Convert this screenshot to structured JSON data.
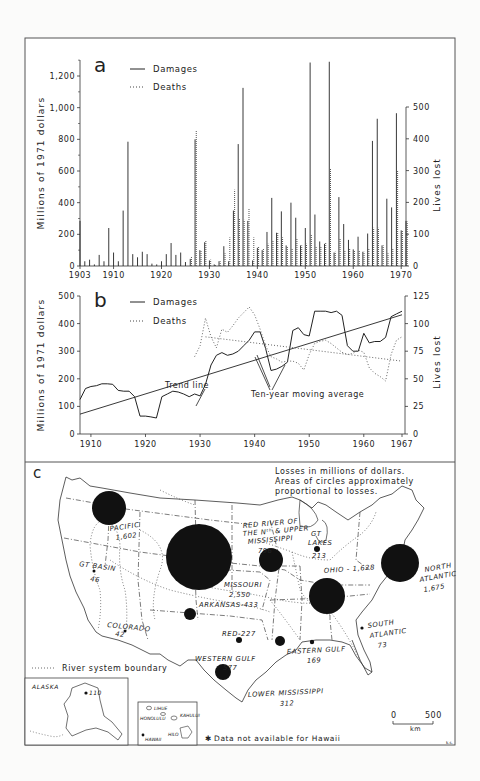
{
  "panels": {
    "a": {
      "label": "a",
      "legend": {
        "damages": "Damages",
        "deaths": "Deaths"
      },
      "y_left_label": "Millions of 1971 dollars",
      "y_right_label": "Lives lost",
      "y_left_ticks": [
        "0",
        "200",
        "400",
        "600",
        "800",
        "1,000",
        "1,200"
      ],
      "y_right_ticks": [
        "0",
        "100",
        "200",
        "300",
        "400",
        "500"
      ],
      "x_ticks": [
        "1903",
        "1910",
        "1920",
        "1930",
        "1940",
        "1950",
        "1960",
        "1970"
      ]
    },
    "b": {
      "label": "b",
      "legend": {
        "damages": "Damages",
        "deaths": "Deaths"
      },
      "y_left_label": "Millions of 1971 dollars",
      "y_right_label": "Lives lost",
      "y_left_ticks": [
        "0",
        "100",
        "200",
        "300",
        "400",
        "500"
      ],
      "y_right_ticks": [
        "0",
        "25",
        "50",
        "75",
        "100",
        "125"
      ],
      "x_ticks": [
        "1910",
        "1920",
        "1930",
        "1940",
        "1950",
        "1960",
        "1967"
      ],
      "annotations": {
        "trend": "Trend line",
        "moving_avg": "Ten-year moving average"
      }
    },
    "c": {
      "label": "c",
      "note_line1": "Losses in millions of dollars.",
      "note_line2": "Areas of circles approximately",
      "note_line3": "proportional to losses.",
      "boundary_legend": "River system boundary",
      "hawaii_note": "Data not available for Hawaii",
      "scale": {
        "zero": "0",
        "max": "500",
        "unit": "km"
      },
      "regions": [
        {
          "name": "PACIFIC",
          "value": "1,602"
        },
        {
          "name": "GT BASIN",
          "value": "46"
        },
        {
          "name": "COLORADO",
          "value": "42"
        },
        {
          "name": "MISSOURI",
          "value": "2,550"
        },
        {
          "name": "ARKANSAS",
          "value": "433"
        },
        {
          "name": "RED",
          "value": "227"
        },
        {
          "name": "WESTERN GULF",
          "value": "577"
        },
        {
          "name": "LOWER MISSISSIPPI",
          "value": "312"
        },
        {
          "name": "EASTERN GULF",
          "value": "169"
        },
        {
          "name": "SOUTH ATLANTIC",
          "value": "73"
        },
        {
          "name": "OHIO",
          "value": "1,628"
        },
        {
          "name": "NORTH ATLANTIC",
          "value": "1,675"
        },
        {
          "name": "GT LAKES",
          "value": "213"
        },
        {
          "name": "RED RIVER OF THE Nth & UPPER MISSISSIPPI",
          "value": "796"
        },
        {
          "name": "ALASKA",
          "value": "110"
        }
      ],
      "hawaii_places": [
        "LIHUE",
        "HONOLULU",
        "KAHULUI",
        "HILO",
        "HAWAII"
      ],
      "alaska_label": "ALASKA",
      "credit": "k.s."
    }
  },
  "chart_data": [
    {
      "type": "bar",
      "title": "a",
      "xlabel": "",
      "ylabel": "Millions of 1971 dollars",
      "y2label": "Lives lost",
      "ylim": [
        0,
        1300
      ],
      "y2lim": [
        0,
        500
      ],
      "x": [
        1903,
        1904,
        1905,
        1906,
        1907,
        1908,
        1909,
        1910,
        1911,
        1912,
        1913,
        1914,
        1915,
        1916,
        1917,
        1918,
        1919,
        1920,
        1921,
        1922,
        1923,
        1924,
        1925,
        1926,
        1927,
        1928,
        1929,
        1930,
        1931,
        1932,
        1933,
        1934,
        1935,
        1936,
        1937,
        1938,
        1939,
        1940,
        1941,
        1942,
        1943,
        1944,
        1945,
        1946,
        1947,
        1948,
        1949,
        1950,
        1951,
        1952,
        1953,
        1954,
        1955,
        1956,
        1957,
        1958,
        1959,
        1960,
        1961,
        1962,
        1963,
        1964,
        1965,
        1966,
        1967,
        1968,
        1969,
        1970,
        1971
      ],
      "series": [
        {
          "name": "Damages",
          "axis": "left",
          "values": [
            285,
            30,
            40,
            10,
            70,
            30,
            240,
            85,
            30,
            350,
            785,
            75,
            55,
            90,
            75,
            15,
            10,
            30,
            75,
            145,
            70,
            85,
            25,
            45,
            800,
            100,
            150,
            35,
            10,
            30,
            125,
            30,
            350,
            770,
            1125,
            285,
            35,
            115,
            100,
            215,
            430,
            210,
            345,
            130,
            400,
            305,
            130,
            240,
            1285,
            325,
            155,
            140,
            1290,
            85,
            435,
            265,
            165,
            105,
            185,
            90,
            205,
            790,
            930,
            130,
            425,
            370,
            965,
            225,
            285
          ]
        },
        {
          "name": "Deaths",
          "axis": "right",
          "values": [
            0,
            0,
            0,
            0,
            0,
            0,
            0,
            0,
            0,
            0,
            0,
            0,
            0,
            0,
            0,
            0,
            0,
            0,
            0,
            0,
            0,
            0,
            0,
            30,
            425,
            50,
            80,
            20,
            5,
            15,
            40,
            90,
            240,
            150,
            145,
            180,
            90,
            60,
            55,
            70,
            80,
            105,
            90,
            60,
            55,
            85,
            65,
            70,
            100,
            60,
            60,
            75,
            305,
            45,
            85,
            50,
            55,
            50,
            50,
            45,
            55,
            120,
            120,
            65,
            40,
            55,
            300,
            110,
            140
          ]
        }
      ]
    },
    {
      "type": "line",
      "title": "b",
      "ylabel": "Millions of 1971 dollars",
      "y2label": "Lives lost",
      "ylim": [
        0,
        500
      ],
      "y2lim": [
        0,
        125
      ],
      "x": [
        1908,
        1909,
        1910,
        1911,
        1912,
        1913,
        1914,
        1915,
        1916,
        1917,
        1918,
        1919,
        1920,
        1921,
        1922,
        1923,
        1924,
        1925,
        1926,
        1927,
        1928,
        1929,
        1930,
        1931,
        1932,
        1933,
        1934,
        1935,
        1936,
        1937,
        1938,
        1939,
        1940,
        1941,
        1942,
        1943,
        1944,
        1945,
        1946,
        1947,
        1948,
        1949,
        1950,
        1951,
        1952,
        1953,
        1954,
        1955,
        1956,
        1957,
        1958,
        1959,
        1960,
        1961,
        1962,
        1963,
        1964,
        1965,
        1966,
        1967
      ],
      "series": [
        {
          "name": "Damages (ten-year moving average)",
          "axis": "left",
          "values": [
            125,
            165,
            172,
            175,
            182,
            182,
            180,
            158,
            155,
            155,
            135,
            65,
            65,
            62,
            58,
            135,
            145,
            155,
            152,
            145,
            135,
            145,
            138,
            180,
            250,
            285,
            295,
            285,
            290,
            300,
            320,
            340,
            370,
            370,
            310,
            230,
            235,
            245,
            260,
            375,
            385,
            360,
            355,
            445,
            445,
            445,
            440,
            445,
            430,
            320,
            300,
            300,
            365,
            330,
            335,
            335,
            350,
            425,
            435,
            445
          ]
        },
        {
          "name": "Deaths (ten-year moving average)",
          "axis": "right",
          "values": [
            null,
            null,
            null,
            null,
            null,
            null,
            null,
            null,
            null,
            null,
            null,
            null,
            null,
            null,
            null,
            null,
            null,
            null,
            null,
            null,
            null,
            70,
            80,
            105,
            88,
            78,
            95,
            92,
            98,
            105,
            110,
            115,
            108,
            95,
            80,
            70,
            68,
            65,
            66,
            66,
            64,
            58,
            72,
            82,
            84,
            85,
            82,
            78,
            74,
            72,
            73,
            76,
            74,
            60,
            55,
            52,
            48,
            72,
            85,
            88
          ]
        },
        {
          "name": "Damages trend line",
          "axis": "left",
          "values_endpoints": {
            "1908": 72,
            "1967": 432
          }
        },
        {
          "name": "Deaths trend line",
          "axis": "right",
          "values_endpoints": {
            "1931": 88,
            "1967": 66
          }
        }
      ],
      "annotations": [
        "Trend line",
        "Ten-year moving average"
      ]
    }
  ]
}
